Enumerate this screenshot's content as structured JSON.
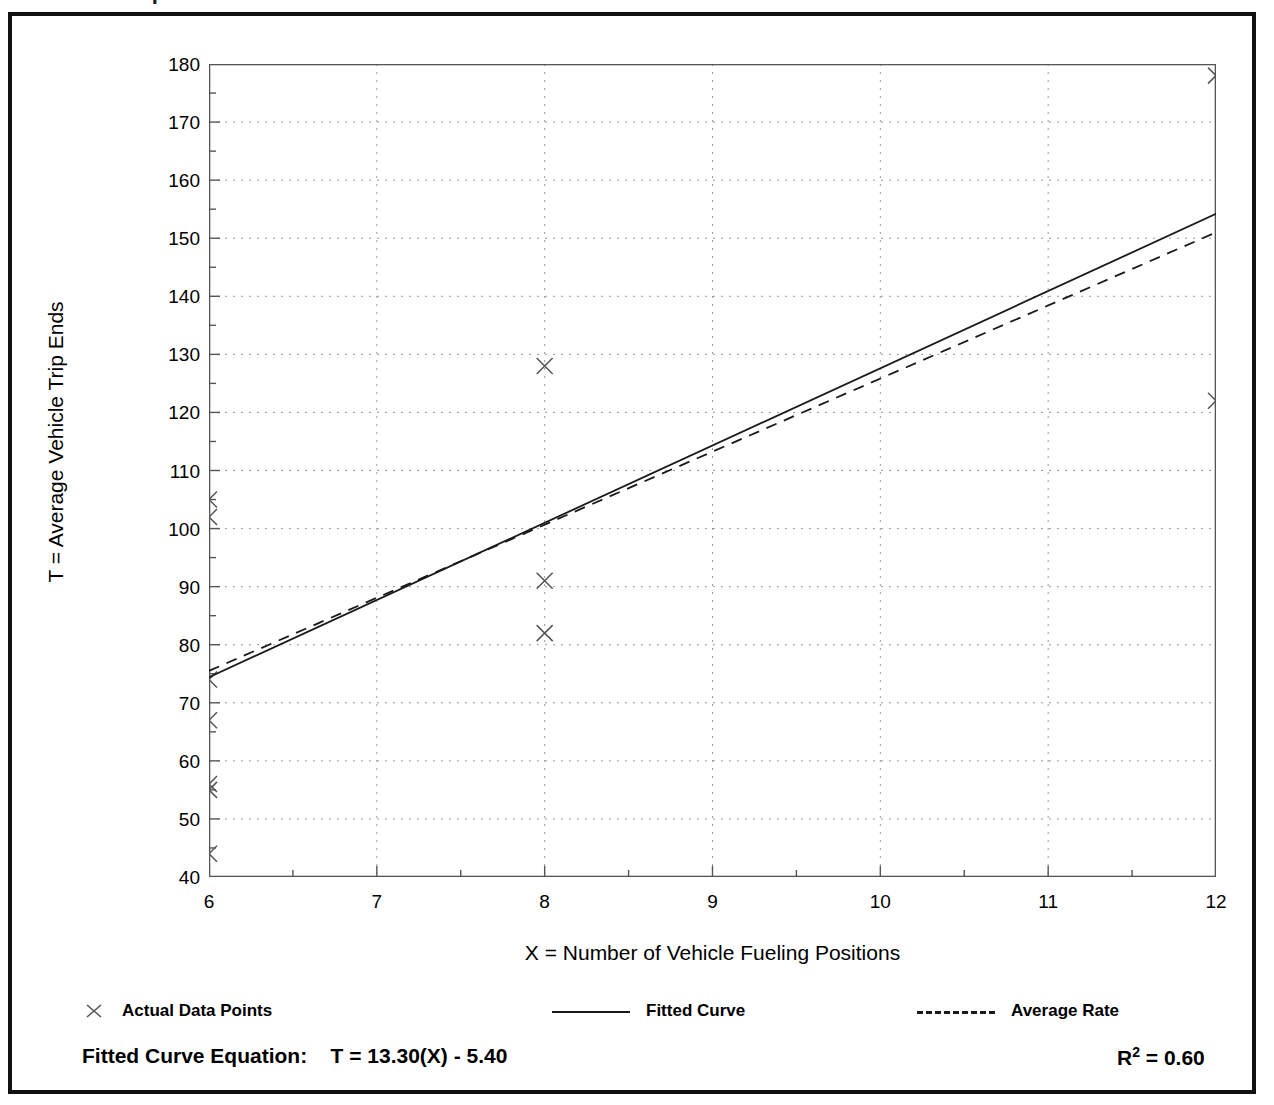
{
  "page": {
    "title_partial": "Data Plot - Trip Ends"
  },
  "figure": {
    "frame_color": "#111111",
    "background": "#ffffff"
  },
  "axes": {
    "y_title": "T = Average Vehicle Trip Ends",
    "x_title": "X = Number of Vehicle Fueling Positions",
    "y_ticks": [
      "40",
      "50",
      "60",
      "70",
      "80",
      "90",
      "100",
      "110",
      "120",
      "130",
      "140",
      "150",
      "160",
      "170",
      "180"
    ],
    "x_ticks": [
      "6",
      "7",
      "8",
      "9",
      "10",
      "11",
      "12"
    ]
  },
  "legend": {
    "actual_label": "Actual Data Points",
    "fitted_label": "Fitted Curve",
    "average_label": "Average Rate",
    "actual_marker": "x-marker-icon",
    "fitted_marker": "solid-line-icon",
    "average_marker": "dashed-line-icon"
  },
  "footer": {
    "equation_label": "Fitted Curve Equation:",
    "equation": "T = 13.30(X) - 5.40",
    "equation_full": "Fitted Curve Equation:  T = 13.30(X) - 5.40",
    "r_squared_symbol": "R",
    "r_squared_exponent": "2",
    "r_squared_value": "= 0.60",
    "r_squared_full": "R2 = 0.60"
  },
  "chart_data": {
    "type": "scatter",
    "title": "",
    "xlabel": "X = Number of Vehicle Fueling Positions",
    "ylabel": "T = Average Vehicle Trip Ends",
    "xlim": [
      6,
      12
    ],
    "ylim": [
      40,
      180
    ],
    "x_major_step": 1,
    "x_minor_step": 0.5,
    "y_major_step": 10,
    "y_minor_step": 5,
    "grid": true,
    "grid_style": "dotted",
    "legend_position": "below-axes",
    "series": [
      {
        "name": "Actual Data Points",
        "type": "scatter",
        "marker": "x",
        "color": "#555555",
        "points": [
          {
            "x": 6,
            "y": 105
          },
          {
            "x": 6,
            "y": 102
          },
          {
            "x": 6,
            "y": 74
          },
          {
            "x": 6,
            "y": 67
          },
          {
            "x": 6,
            "y": 56
          },
          {
            "x": 6,
            "y": 55
          },
          {
            "x": 6,
            "y": 44
          },
          {
            "x": 8,
            "y": 128
          },
          {
            "x": 8,
            "y": 91
          },
          {
            "x": 8,
            "y": 82
          },
          {
            "x": 12,
            "y": 178
          },
          {
            "x": 12,
            "y": 122
          }
        ]
      },
      {
        "name": "Fitted Curve",
        "type": "line",
        "style": "solid",
        "color": "#1a1a1a",
        "equation": "T = 13.30(X) - 5.40",
        "slope": 13.3,
        "intercept": -5.4,
        "endpoints": [
          {
            "x": 6,
            "y": 74.4
          },
          {
            "x": 12,
            "y": 154.2
          }
        ]
      },
      {
        "name": "Average Rate",
        "type": "line",
        "style": "dashed",
        "color": "#1a1a1a",
        "endpoints": [
          {
            "x": 6,
            "y": 75.5
          },
          {
            "x": 12,
            "y": 151.0
          }
        ]
      }
    ],
    "r_squared": 0.6
  }
}
